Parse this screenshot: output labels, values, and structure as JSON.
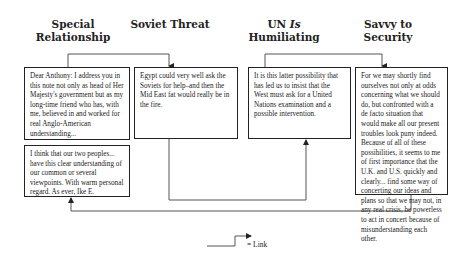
{
  "columns": [
    {
      "id": "special-relationship",
      "heading_line1": "Special",
      "heading_line2": "Relationship"
    },
    {
      "id": "soviet-threat",
      "heading_line1": "Soviet Threat",
      "heading_line2": ""
    },
    {
      "id": "un-is-humiliating",
      "heading_line1_pre": "UN ",
      "heading_line1_italic": "Is",
      "heading_line2": "Humiliating"
    },
    {
      "id": "savvy-to-security",
      "heading_line1": "Savvy to",
      "heading_line2": "Security"
    }
  ],
  "boxes": [
    {
      "id": "dear-anthony",
      "text": "Dear Anthony: I address you in this note not only as head of Her Majesty's government but as my long-time friend who has, with me, believed in and worked for real Anglo-American understanding..."
    },
    {
      "id": "egypt",
      "text": "Egypt could very well ask the Soviets for help–and then the Mid East fat would really be in the fire."
    },
    {
      "id": "latter-possibility",
      "text": "It is this latter possibility that has led us to insist that the West must ask for a United Nations examination and a possible intervention."
    },
    {
      "id": "for-we-may",
      "text": "For we may shortly find ourselves not only at odds concerning what we should do, but confronted with a de facto situation that would make all our present troubles look puny indeed. Because of all of these possibilities, it seems to me of first importance that the U.K. and U.S. quickly and clearly... find some way of concerting our ideas and plans so that we may not, in any real crisis, be powerless to act in concert because of misunderstanding each other."
    },
    {
      "id": "i-think",
      "text": "I think that our two peoples... have this clear understanding of our common or several viewpoints. With warm personal regard. As ever, Ike E."
    }
  ],
  "links": [
    {
      "from": "dear-anthony",
      "to": "egypt"
    },
    {
      "from": "egypt",
      "to": "latter-possibility"
    },
    {
      "from": "latter-possibility",
      "to": "for-we-may"
    },
    {
      "from": "for-we-may",
      "to": "i-think"
    }
  ],
  "legend": {
    "label": "= Link"
  },
  "colors": {
    "line": "#555555",
    "border": "#222222",
    "text": "#222222"
  }
}
